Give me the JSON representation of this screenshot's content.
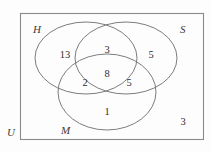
{
  "diagram": {
    "type": "venn",
    "universe": {
      "label": "U",
      "label_position": "outside-bottom-left",
      "outside_count": "3"
    },
    "sets": [
      {
        "key": "H",
        "label": "H",
        "label_position": "top-left"
      },
      {
        "key": "S",
        "label": "S",
        "label_position": "top-right"
      },
      {
        "key": "M",
        "label": "M",
        "label_position": "bottom-left"
      }
    ],
    "regions": [
      {
        "key": "H_only",
        "label": "13",
        "sets": "H"
      },
      {
        "key": "S_only",
        "label": "5",
        "sets": "S"
      },
      {
        "key": "M_only",
        "label": "1",
        "sets": "M"
      },
      {
        "key": "H_and_S",
        "label": "3",
        "sets": "H,S"
      },
      {
        "key": "H_and_M",
        "label": "2",
        "sets": "H,M"
      },
      {
        "key": "S_and_M",
        "label": "5",
        "sets": "S,M"
      },
      {
        "key": "H_S_M",
        "label": "8",
        "sets": "H,S,M"
      },
      {
        "key": "outside",
        "label": "3",
        "sets": "none"
      }
    ],
    "colors": {
      "stroke": "#6d6d6d",
      "frame": "#8a8a8a",
      "text": "#2e2e2e",
      "label": "#3a3a3a",
      "background": "#fdfdfd"
    }
  }
}
